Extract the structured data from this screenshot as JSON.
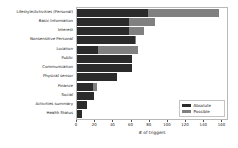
{
  "chart_data": {
    "type": "bar",
    "orientation": "horizontal",
    "title": "",
    "xlabel": "# of triggers",
    "ylabel": "",
    "xlim": [
      0,
      165
    ],
    "xticks": [
      0,
      20,
      40,
      60,
      80,
      100,
      120,
      140,
      160
    ],
    "grid": false,
    "legend_position": "lower right",
    "categories": [
      "Lifestyle/Activities (Personal)",
      "Basic Information",
      "Interest",
      "Nonsensitive Personal",
      "Location",
      "Public",
      "Communication",
      "Physical sensor",
      "Finance",
      "Social",
      "Activities summary",
      "Health Status"
    ],
    "series": [
      {
        "name": "Possible",
        "color": "#808080",
        "values": [
          156,
          86,
          74,
          65,
          67,
          61,
          60,
          44,
          22,
          19,
          11,
          5
        ]
      },
      {
        "name": "Absolute",
        "color": "#2b2b2b",
        "values": [
          78,
          57,
          57,
          64,
          23,
          61,
          60,
          44,
          18,
          19,
          11,
          5
        ]
      }
    ]
  },
  "legend": {
    "items": [
      {
        "label": "Absolute",
        "color": "#2b2b2b"
      },
      {
        "label": "Possible",
        "color": "#808080"
      }
    ]
  },
  "axis": {
    "xlabel": "# of triggers",
    "tick_labels": [
      "0",
      "20",
      "40",
      "60",
      "80",
      "100",
      "120",
      "140",
      "160"
    ]
  }
}
